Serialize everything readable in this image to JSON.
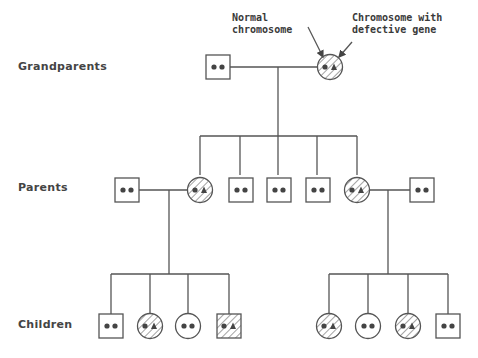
{
  "diagram": {
    "type": "pedigree",
    "colors": {
      "line": "#555555",
      "dot": "#444444",
      "hatch": "#555555",
      "text": "#444444",
      "background": "#ffffff"
    },
    "generation_labels": [
      {
        "id": "grandparents",
        "label": "Grandparents"
      },
      {
        "id": "parents",
        "label": "Parents"
      },
      {
        "id": "children",
        "label": "Children"
      }
    ],
    "annotations": {
      "normal": "Normal\nchromosome",
      "defective": "Chromosome with\ndefective gene"
    },
    "legend": {
      "square": "male",
      "circle": "female",
      "dot": "normal chromosome",
      "triangle": "chromosome with defective gene",
      "hatched": "carrier / affected"
    },
    "individuals": {
      "grandparents": [
        {
          "shape": "square",
          "genotype": "normal-normal",
          "hatched": false
        },
        {
          "shape": "circle",
          "genotype": "normal-defective",
          "hatched": true
        }
      ],
      "parents": [
        {
          "shape": "square",
          "genotype": "normal-normal",
          "hatched": false,
          "role": "spouse"
        },
        {
          "shape": "circle",
          "genotype": "normal-defective",
          "hatched": true
        },
        {
          "shape": "square",
          "genotype": "normal-normal",
          "hatched": false
        },
        {
          "shape": "square",
          "genotype": "normal-normal",
          "hatched": false
        },
        {
          "shape": "square",
          "genotype": "normal-normal",
          "hatched": false
        },
        {
          "shape": "circle",
          "genotype": "normal-defective",
          "hatched": true
        },
        {
          "shape": "square",
          "genotype": "normal-normal",
          "hatched": false,
          "role": "spouse"
        }
      ],
      "children_left": [
        {
          "shape": "square",
          "genotype": "normal-normal",
          "hatched": false
        },
        {
          "shape": "circle",
          "genotype": "normal-defective",
          "hatched": true
        },
        {
          "shape": "circle",
          "genotype": "normal-normal",
          "hatched": false
        },
        {
          "shape": "square",
          "genotype": "normal-defective",
          "hatched": true
        }
      ],
      "children_right": [
        {
          "shape": "circle",
          "genotype": "normal-defective",
          "hatched": true
        },
        {
          "shape": "circle",
          "genotype": "normal-normal",
          "hatched": false
        },
        {
          "shape": "circle",
          "genotype": "normal-defective",
          "hatched": true
        },
        {
          "shape": "square",
          "genotype": "normal-normal",
          "hatched": false
        }
      ]
    }
  }
}
